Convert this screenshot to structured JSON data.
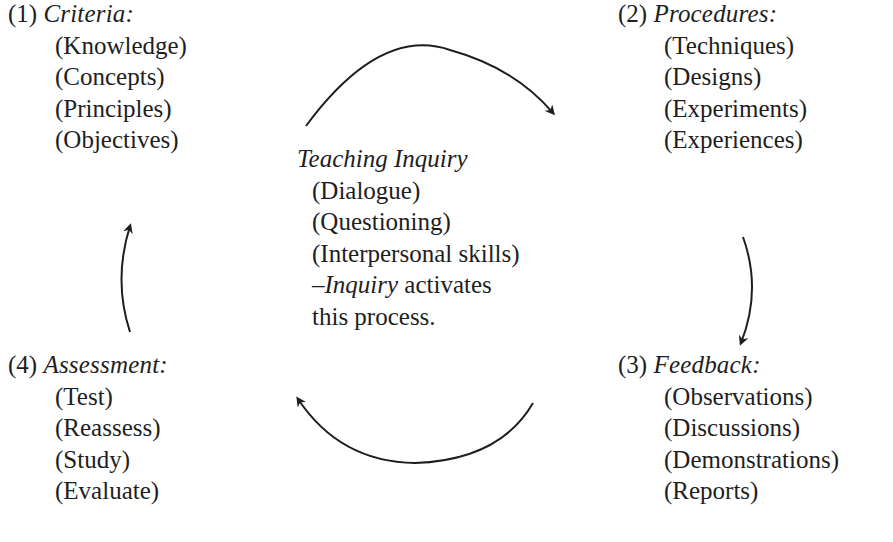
{
  "diagram": {
    "type": "cycle",
    "center": {
      "title": "Teaching Inquiry",
      "items": [
        "(Dialogue)",
        "(Questioning)",
        "(Interpersonal skills)"
      ],
      "note_dash": "–",
      "note_emphasis": "Inquiry",
      "note_rest_line1": " activates",
      "note_line2": "this process."
    },
    "stages": [
      {
        "number": "(1)",
        "label": "Criteria:",
        "items": [
          "(Knowledge)",
          "(Concepts)",
          "(Principles)",
          "(Objectives)"
        ]
      },
      {
        "number": "(2)",
        "label": "Procedures:",
        "items": [
          "(Techniques)",
          "(Designs)",
          "(Experiments)",
          "(Experiences)"
        ]
      },
      {
        "number": "(3)",
        "label": "Feedback:",
        "items": [
          "(Observations)",
          "(Discussions)",
          "(Demonstrations)",
          "(Reports)"
        ]
      },
      {
        "number": "(4)",
        "label": "Assessment:",
        "items": [
          "(Test)",
          "(Reassess)",
          "(Study)",
          "(Evaluate)"
        ]
      }
    ],
    "arrows": [
      {
        "from": "(1) Criteria",
        "to": "(2) Procedures",
        "direction": "clockwise"
      },
      {
        "from": "(2) Procedures",
        "to": "(3) Feedback",
        "direction": "clockwise"
      },
      {
        "from": "(3) Feedback",
        "to": "(4) Assessment",
        "direction": "clockwise"
      },
      {
        "from": "(4) Assessment",
        "to": "(1) Criteria",
        "direction": "clockwise"
      }
    ],
    "colors": {
      "text": "#1e1e1e",
      "arrow": "#1e1e1e",
      "background": "#ffffff"
    }
  }
}
